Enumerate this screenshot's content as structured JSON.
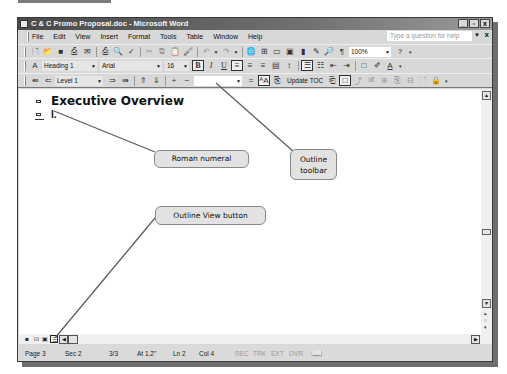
{
  "window": {
    "title": "C & C Promo Proposal.doc - Microsoft Word",
    "controls": {
      "minimize": "_",
      "restore": "🗗",
      "close": "x"
    }
  },
  "menubar": {
    "items": [
      "File",
      "Edit",
      "View",
      "Insert",
      "Format",
      "Tools",
      "Table",
      "Window",
      "Help"
    ],
    "help_placeholder": "Type a question for help",
    "help_close": "x"
  },
  "standard_toolbar": {
    "icons": [
      "new-icon",
      "open-icon",
      "save-icon",
      "permission-icon",
      "email-icon",
      "print-icon",
      "print-preview-icon",
      "spelling-icon",
      "cut-icon",
      "copy-icon",
      "paste-icon",
      "format-painter-icon",
      "undo-icon",
      "redo-icon",
      "hyperlink-icon",
      "tables-borders-icon",
      "insert-table-icon",
      "insert-excel-icon",
      "columns-icon",
      "drawing-icon",
      "document-map-icon",
      "show-hide-icon"
    ],
    "zoom": "100%"
  },
  "formatting_toolbar": {
    "style": "Heading 1",
    "font": "Arial",
    "size": "16",
    "bold_label": "B",
    "italic_label": "I",
    "underline_label": "U"
  },
  "outline_toolbar": {
    "show_level": "Level 1",
    "update_toc_label": "Update TOC"
  },
  "document": {
    "heading": "Executive Overview",
    "numeral": "I."
  },
  "callouts": {
    "roman_numeral": "Roman numeral",
    "outline_toolbar": "Outline toolbar",
    "outline_view_button": "Outline View button"
  },
  "status_bar": {
    "page": "Page 3",
    "section": "Sec 2",
    "page_of": "3/3",
    "at": "At 1.2\"",
    "line": "Ln 2",
    "col": "Col 4",
    "rec": "REC",
    "trk": "TRK",
    "ext": "EXT",
    "ovr": "OVR"
  }
}
